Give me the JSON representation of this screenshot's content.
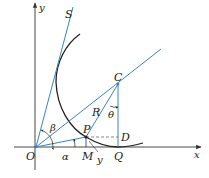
{
  "figure": {
    "type": "geometry-diagram",
    "colors": {
      "axis": "#333333",
      "blue_line": "#3a85b8",
      "curve": "#222222",
      "dashed": "#555555",
      "background": "#ffffff"
    },
    "axes": {
      "x_label": "x",
      "y_label": "y"
    },
    "points": {
      "O": "O",
      "S": "S",
      "C": "C",
      "R": "R",
      "P": "P",
      "D": "D",
      "M": "M",
      "Q": "Q",
      "y_tick": "y"
    },
    "angles": {
      "alpha": "α",
      "beta": "β",
      "theta": "θ"
    }
  }
}
